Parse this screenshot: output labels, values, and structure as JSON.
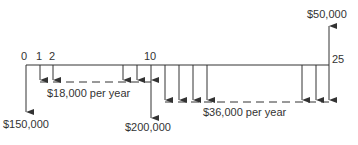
{
  "diagram": {
    "type": "cash-flow-diagram",
    "ticks": [
      {
        "label": "0",
        "x": 26
      },
      {
        "label": "1",
        "x": 40
      },
      {
        "label": "2",
        "x": 53
      },
      {
        "label": "10",
        "x": 151
      },
      {
        "label": "25",
        "x": 329
      }
    ],
    "labels": {
      "initial": "$150,000",
      "year10": "$200,000",
      "final_salvage": "$50,000",
      "annual1": "$18,000 per year",
      "annual2": "$36,000 per year"
    },
    "flows": [
      {
        "year": 0,
        "amount": -150000
      },
      {
        "years": "1-10",
        "amount_per_year": -18000
      },
      {
        "year": 10,
        "amount": -200000
      },
      {
        "years": "11-25",
        "amount_per_year": -36000
      },
      {
        "year": 25,
        "amount": 50000
      }
    ],
    "colors": {
      "line": "#333333"
    }
  }
}
